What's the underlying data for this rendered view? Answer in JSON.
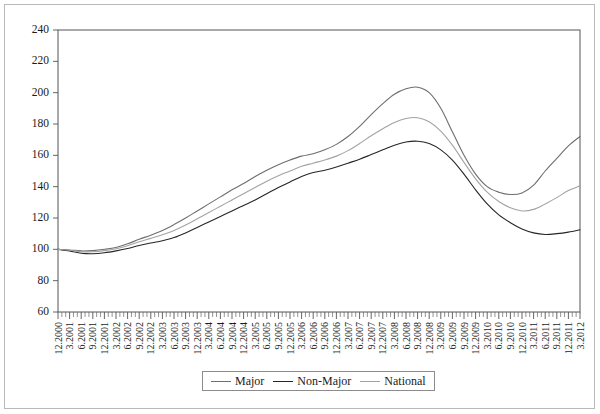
{
  "chart_data": {
    "type": "line",
    "title": "",
    "xlabel": "",
    "ylabel": "",
    "ylim": [
      60,
      240
    ],
    "ytick_step": 20,
    "yticks": [
      60,
      80,
      100,
      120,
      140,
      160,
      180,
      200,
      220,
      240
    ],
    "grid": false,
    "legend_position": "bottom-center",
    "x_tick_interval": "monthly",
    "x_label_interval": "quarterly",
    "categories": [
      "12.2000",
      "3.2001",
      "6.2001",
      "9.2001",
      "12.2001",
      "3.2002",
      "6.2002",
      "9.2002",
      "12.2002",
      "3.2003",
      "6.2003",
      "9.2003",
      "12.2003",
      "3.2004",
      "6.2004",
      "9.2004",
      "12.2004",
      "3.2005",
      "6.2005",
      "9.2005",
      "12.2005",
      "3.2006",
      "6.2006",
      "9.2006",
      "12.2006",
      "3.2007",
      "6.2007",
      "9.2007",
      "12.2007",
      "3.2008",
      "6.2008",
      "9.2008",
      "12.2008",
      "3.2009",
      "6.2009",
      "9.2009",
      "12.2009",
      "3.2010",
      "6.2010",
      "9.2010",
      "12.2010",
      "3.2011",
      "6.2011",
      "9.2011",
      "12.2011",
      "3.2012"
    ],
    "series": [
      {
        "name": "Major",
        "color": "#6e6e6e",
        "values": [
          100.0,
          99.6,
          99.0,
          99.2,
          100.0,
          101.2,
          103.5,
          106.4,
          109.0,
          112.0,
          115.8,
          120.0,
          124.5,
          129.0,
          133.5,
          138.0,
          142.0,
          146.5,
          150.5,
          154.0,
          157.0,
          159.5,
          161.0,
          163.5,
          167.0,
          172.0,
          178.5,
          186.0,
          193.0,
          199.0,
          202.5,
          203.5,
          200.0,
          190.0,
          175.0,
          160.0,
          148.0,
          140.0,
          136.5,
          135.0,
          136.0,
          141.0,
          150.0,
          158.0,
          166.0,
          172.0
        ]
      },
      {
        "name": "Non-Major",
        "color": "#262626",
        "values": [
          100.0,
          99.0,
          97.5,
          97.2,
          97.8,
          99.0,
          100.5,
          102.5,
          104.0,
          105.5,
          107.5,
          110.5,
          114.0,
          117.5,
          121.0,
          124.5,
          128.0,
          131.5,
          135.5,
          139.5,
          143.0,
          146.5,
          149.0,
          150.5,
          152.5,
          155.0,
          157.5,
          160.5,
          163.5,
          166.5,
          168.5,
          169.0,
          167.5,
          163.5,
          157.0,
          148.0,
          138.0,
          129.0,
          122.0,
          117.0,
          113.0,
          110.5,
          109.5,
          110.0,
          111.0,
          112.5
        ]
      },
      {
        "name": "National",
        "color": "#a3a3a3",
        "values": [
          100.0,
          99.4,
          98.5,
          98.5,
          99.2,
          100.4,
          102.3,
          104.8,
          107.0,
          109.3,
          112.0,
          115.5,
          119.5,
          123.5,
          127.5,
          131.5,
          135.5,
          139.5,
          143.5,
          147.0,
          150.0,
          153.0,
          155.0,
          157.0,
          159.5,
          163.0,
          167.5,
          172.5,
          177.0,
          181.0,
          183.5,
          184.0,
          181.5,
          175.5,
          166.5,
          155.5,
          145.0,
          136.5,
          130.5,
          126.5,
          124.5,
          125.5,
          129.0,
          133.0,
          137.5,
          140.5
        ]
      }
    ]
  },
  "legend": {
    "entries": [
      {
        "label": "Major",
        "color": "#6e6e6e"
      },
      {
        "label": "Non-Major",
        "color": "#262626"
      },
      {
        "label": "National",
        "color": "#a3a3a3"
      }
    ]
  }
}
